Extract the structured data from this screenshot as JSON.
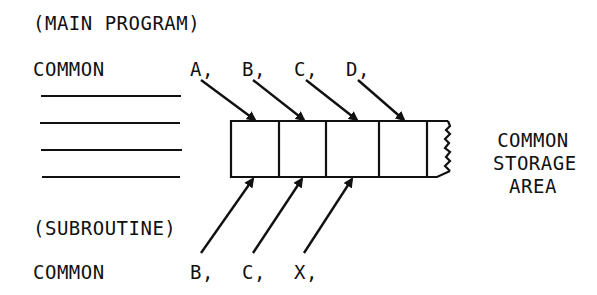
{
  "main_program": {
    "heading": "(MAIN PROGRAM)",
    "common_keyword": "COMMON",
    "variables": [
      "A,",
      "B,",
      "C,",
      "D,"
    ]
  },
  "subroutine": {
    "heading": "(SUBROUTINE)",
    "common_keyword": "COMMON",
    "variables": [
      "B,",
      "C,",
      "X,"
    ]
  },
  "storage_label": {
    "line1": "COMMON",
    "line2": "STORAGE",
    "line3": "AREA"
  },
  "storage_cells": 5,
  "colors": {
    "ink": "#111111",
    "background": "#ffffff"
  }
}
